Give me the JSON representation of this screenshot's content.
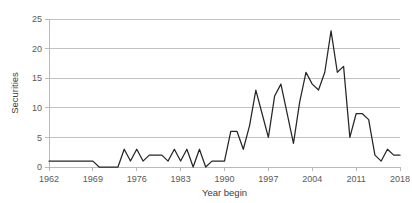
{
  "chart_data": {
    "type": "line",
    "title": "",
    "subtitle": "",
    "xlabel": "Year begin",
    "ylabel": "Securities",
    "xlim": [
      1962,
      2018
    ],
    "ylim": [
      0,
      25
    ],
    "grid": true,
    "legend": false,
    "legend_position": "none",
    "ytick_labels": [
      "0",
      "5",
      "10",
      "15",
      "20",
      "25"
    ],
    "ytick_values": [
      0,
      5,
      10,
      15,
      20,
      25
    ],
    "xtick_labels": [
      "1962",
      "1969",
      "1976",
      "1983",
      "1990",
      "1997",
      "2004",
      "2011",
      "2018"
    ],
    "xtick_values": [
      1962,
      1969,
      1976,
      1983,
      1990,
      1997,
      2004,
      2011,
      2018
    ],
    "series": [
      {
        "name": "Securities",
        "color": "#262626",
        "x": [
          1962,
          1963,
          1964,
          1965,
          1966,
          1967,
          1968,
          1969,
          1970,
          1971,
          1972,
          1973,
          1974,
          1975,
          1976,
          1977,
          1978,
          1979,
          1980,
          1981,
          1982,
          1983,
          1984,
          1985,
          1986,
          1987,
          1988,
          1989,
          1990,
          1991,
          1992,
          1993,
          1994,
          1995,
          1996,
          1997,
          1998,
          1999,
          2000,
          2001,
          2002,
          2003,
          2004,
          2005,
          2006,
          2007,
          2008,
          2009,
          2010,
          2011,
          2012,
          2013,
          2014,
          2015,
          2016,
          2017,
          2018
        ],
        "values": [
          1,
          1,
          1,
          1,
          1,
          1,
          1,
          1,
          0,
          0,
          0,
          0,
          3,
          1,
          3,
          1,
          2,
          2,
          2,
          1,
          3,
          1,
          3,
          0,
          3,
          0,
          1,
          1,
          1,
          6,
          6,
          3,
          7,
          13,
          9,
          5,
          12,
          14,
          9,
          4,
          11,
          16,
          14,
          13,
          16,
          23,
          16,
          17,
          5,
          9,
          9,
          8,
          2,
          1,
          3,
          2,
          2
        ]
      }
    ],
    "max_value": 23,
    "max_value_year": 2007,
    "min_value": 0
  },
  "axes": {
    "y_title": "Securities",
    "x_title": "Year begin"
  }
}
